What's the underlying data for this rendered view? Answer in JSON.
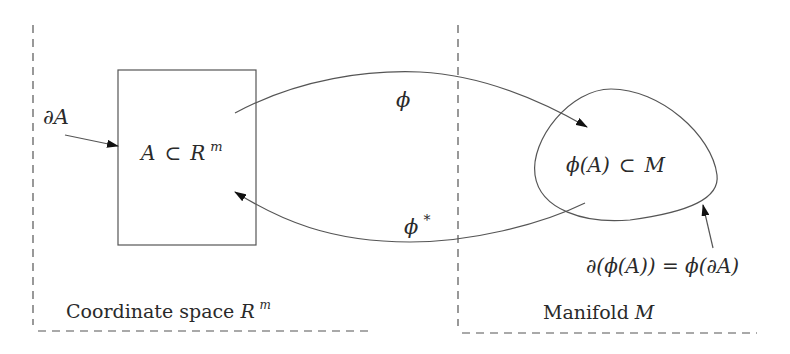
{
  "diagram": {
    "type": "commutative-mapping-diagram",
    "regions": [
      {
        "id": "coordinate-space",
        "label_text": "Coordinate space ",
        "label_math": "R",
        "label_sup": "m"
      },
      {
        "id": "manifold",
        "label_text": "Manifold ",
        "label_math": "M"
      }
    ],
    "nodes": {
      "set_a": {
        "shape": "rectangle",
        "label_a": "A",
        "label_subset": "⊂",
        "label_r": "R",
        "label_sup": "m"
      },
      "image_set": {
        "shape": "blob",
        "label_phi": "ϕ(A)",
        "label_subset": "⊂",
        "label_m": "M"
      }
    },
    "edges": [
      {
        "id": "phi",
        "from": "set_a",
        "to": "image_set",
        "label": "ϕ"
      },
      {
        "id": "phi_star",
        "from": "image_set",
        "to": "set_a",
        "label": "ϕ",
        "label_sup": "*"
      }
    ],
    "annotations": {
      "boundary_a": {
        "label": "∂A",
        "points_to": "set_a"
      },
      "boundary_image": {
        "label": "∂(ϕ(A)) = ϕ(∂A)",
        "points_to": "image_set"
      }
    },
    "colors": {
      "stroke": "#555555",
      "text": "#2a2a2a",
      "background": "#ffffff"
    }
  }
}
